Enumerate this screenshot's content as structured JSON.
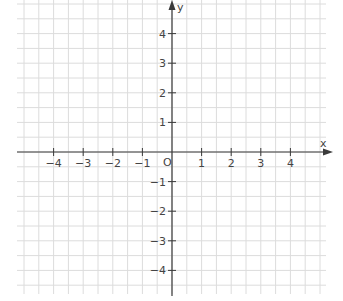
{
  "chart_data": {
    "type": "coordinate-plane",
    "title": "",
    "xlabel": "x",
    "ylabel": "y",
    "xlim": [
      -5,
      5
    ],
    "ylim": [
      -4.7,
      5
    ],
    "x_ticks": [
      -4,
      -3,
      -2,
      -1,
      1,
      2,
      3,
      4
    ],
    "x_tick_labels": [
      "−4",
      "−3",
      "−2",
      "−1",
      "1",
      "2",
      "3",
      "4"
    ],
    "y_ticks": [
      4,
      3,
      2,
      1,
      -1,
      -2,
      -3,
      -4
    ],
    "y_tick_labels": [
      "4",
      "3",
      "2",
      "1",
      "−1",
      "−2",
      "−3",
      "−4"
    ],
    "origin_label": "O",
    "grid": true,
    "grid_step": 0.5,
    "data_points": []
  },
  "colors": {
    "grid": "#dcdcdc",
    "axis": "#3a3a3a",
    "label": "#444444"
  }
}
